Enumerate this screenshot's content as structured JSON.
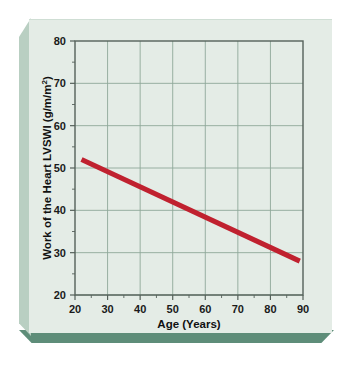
{
  "figure": {
    "background_color": "#ffffff",
    "plaque_face_color": "#e4ece6",
    "plaque_bevel_left_color": "#b9cfc2",
    "plaque_shadow_color": "#5e8d79"
  },
  "chart_data": {
    "type": "line",
    "title": "",
    "subtitle": "",
    "xlabel": "Age (Years)",
    "ylabel": "Work of the Heart LVSWI (g/m/m²)",
    "ylabel_main": "Work of the Heart LVSWI (g/m/m",
    "ylabel_superscript": "2",
    "ylabel_suffix": ")",
    "xlim": [
      20,
      90
    ],
    "ylim": [
      20,
      80
    ],
    "xticks": [
      20,
      30,
      40,
      50,
      60,
      70,
      80,
      90
    ],
    "yticks": [
      20,
      30,
      40,
      50,
      60,
      70,
      80
    ],
    "xtick_labels": [
      "20",
      "30",
      "40",
      "50",
      "60",
      "70",
      "80",
      "90"
    ],
    "ytick_labels": [
      "20",
      "30",
      "40",
      "50",
      "60",
      "70",
      "80"
    ],
    "x_minor_step": 5,
    "y_minor_step": 5,
    "grid": true,
    "grid_color": "#8fa89a",
    "plot_background": "#e4ece6",
    "frame_color": "#55615a",
    "legend": null,
    "legend_position": "none",
    "series": [
      {
        "name": "LVSWI regression",
        "color": "#c0212f",
        "line_width": 5,
        "x": [
          22,
          89
        ],
        "y": [
          52,
          28
        ],
        "points": [
          {
            "x": 22,
            "y": 52
          },
          {
            "x": 30,
            "y": 49.1
          },
          {
            "x": 40,
            "y": 45.5
          },
          {
            "x": 50,
            "y": 41.9
          },
          {
            "x": 60,
            "y": 38.4
          },
          {
            "x": 70,
            "y": 34.8
          },
          {
            "x": 80,
            "y": 31.2
          },
          {
            "x": 89,
            "y": 28
          }
        ]
      }
    ]
  }
}
